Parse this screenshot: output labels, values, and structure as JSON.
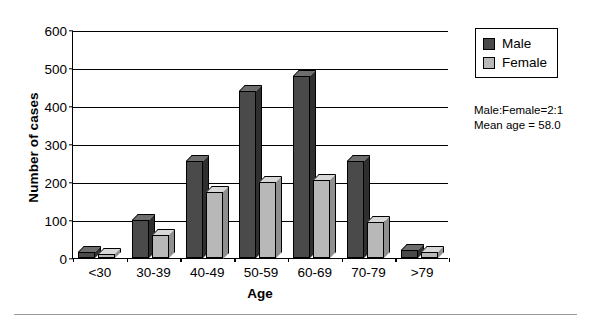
{
  "chart_data": {
    "type": "bar",
    "title": "",
    "xlabel": "Age",
    "ylabel": "Number of cases",
    "categories": [
      "<30",
      "30-39",
      "40-49",
      "50-59",
      "60-69",
      "70-79",
      ">79"
    ],
    "series": [
      {
        "name": "Male",
        "color": "#4a4a4a",
        "values": [
          15,
          100,
          255,
          440,
          480,
          255,
          20
        ]
      },
      {
        "name": "Female",
        "color": "#b8b8b8",
        "values": [
          10,
          60,
          175,
          200,
          205,
          95,
          15
        ]
      }
    ],
    "ylim": [
      0,
      600
    ],
    "ytick_values": [
      0,
      100,
      200,
      300,
      400,
      500,
      600
    ],
    "ytick_labels": [
      "0",
      "100",
      "200",
      "300",
      "400",
      "500",
      "600"
    ],
    "grid": true,
    "grid_axis": "y",
    "legend_position": "outside-top-right",
    "style": "3d-bars",
    "annotations": [
      "Male:Female=2:1",
      "Mean age = 58.0"
    ]
  },
  "legend": {
    "entries": [
      {
        "label": "Male"
      },
      {
        "label": "Female"
      }
    ]
  },
  "colors": {
    "male": "#4a4a4a",
    "male_top": "#6e6e6e",
    "male_side": "#2f2f2f",
    "female": "#b8b8b8",
    "female_top": "#d8d8d8",
    "female_side": "#8f8f8f",
    "axis": "#000000"
  }
}
